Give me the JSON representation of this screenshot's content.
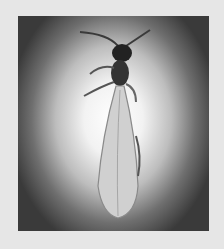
{
  "image": {
    "description": "Grayscale photograph of a winged termite (alate) viewed from above on a vignetted light background, framed by a light gray border",
    "subject": "winged termite",
    "colors": {
      "frame": "#e6e6e6",
      "background_center": "#ffffff",
      "background_edge": "#3a3a3a",
      "body": "#2a2a2a",
      "wings": "#cfcfcf"
    }
  }
}
